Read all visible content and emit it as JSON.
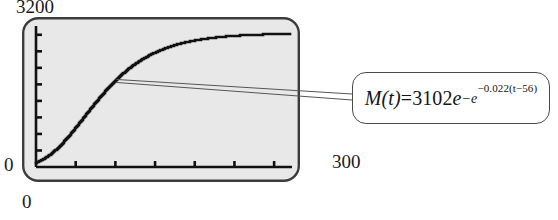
{
  "figure": {
    "kind": "graphing-calculator-plot-with-callout",
    "background_color": "#ffffff"
  },
  "axes": {
    "y_max_label": "3200",
    "y_min_label": "0",
    "x_min_label": "0",
    "x_max_label": "300"
  },
  "callout": {
    "formula_plain": "M(t) = 3102e^(-e^(-0.022(t-56)))",
    "m_of_t": "M(t)",
    "equals": " = ",
    "amplitude": "3102",
    "base_e": "e",
    "minus_e": "−e",
    "inner_exponent": "−0.022(t−56)",
    "border_color": "#4a4a4a",
    "text_color": "#141414"
  },
  "screen": {
    "fill_color": "#e8e8e8",
    "border_color": "#3c3c3c",
    "trace_color": "#111111",
    "y_tick_count": 8,
    "x_tick_count": 6
  },
  "chart_data": {
    "type": "line",
    "title": "",
    "xlabel": "",
    "ylabel": "",
    "xlim": [
      0,
      300
    ],
    "ylim": [
      0,
      3200
    ],
    "grid": false,
    "legend": null,
    "equation": "M(t) = 3102*exp(-exp(-0.022*(t-56)))",
    "parameters": {
      "asymptote": 3102,
      "rate": 0.022,
      "inflection_t": 56
    },
    "series": [
      {
        "name": "M(t)",
        "x": [
          0,
          10,
          20,
          30,
          40,
          50,
          56,
          60,
          70,
          80,
          90,
          100,
          110,
          120,
          130,
          140,
          150,
          160,
          170,
          180,
          190,
          200,
          210,
          220,
          230,
          240,
          250,
          260,
          270,
          280,
          290,
          300
        ],
        "values": [
          90,
          155,
          248,
          372,
          528,
          712,
          833,
          916,
          1135,
          1360,
          1582,
          1795,
          1994,
          2175,
          2338,
          2482,
          2607,
          2715,
          2807,
          2885,
          2950,
          3004,
          3049,
          3086,
          3116,
          3141,
          3161,
          3178,
          3191,
          3202,
          3210,
          3217
        ]
      }
    ]
  }
}
